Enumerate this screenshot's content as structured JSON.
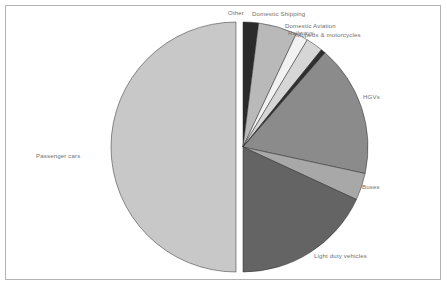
{
  "figure": {
    "background_color": "#ffffff",
    "border_color": "#b4b4b4",
    "label_color": "#6f6f6f"
  },
  "chart_data": {
    "type": "pie",
    "title": "",
    "subtitle": "",
    "xlabel": "",
    "ylabel": "",
    "legend_position": "none",
    "grid": false,
    "exploded_slice": "Passenger cars",
    "start_angle_deg": -90,
    "direction": "clockwise",
    "categories": [
      "Other",
      "Domestic Shipping",
      "Domestic Aviation",
      "Railways",
      "Mopeds & motorcycles",
      "HGVs",
      "Buses",
      "Light duty vehicles",
      "Passenger cars"
    ],
    "values": [
      2.0,
      5.0,
      1.6,
      2.2,
      0.6,
      17.0,
      3.5,
      18.1,
      50.0
    ],
    "unit": "%",
    "colors": [
      "#2b2b2b",
      "#b9b9b9",
      "#f2f2f2",
      "#d6d6d6",
      "#2f2f2f",
      "#8b8b8b",
      "#a8a8a8",
      "#646464",
      "#c8c8c8"
    ],
    "slices": [
      {
        "label": "Other",
        "value": 2.0,
        "color": "#2b2b2b"
      },
      {
        "label": "Domestic Shipping",
        "value": 5.0,
        "color": "#b9b9b9"
      },
      {
        "label": "Domestic Aviation",
        "value": 1.6,
        "color": "#f2f2f2"
      },
      {
        "label": "Railways",
        "value": 2.2,
        "color": "#d6d6d6"
      },
      {
        "label": "Mopeds & motorcycles",
        "value": 0.6,
        "color": "#2f2f2f"
      },
      {
        "label": "HGVs",
        "value": 17.0,
        "color": "#8b8b8b"
      },
      {
        "label": "Buses",
        "value": 3.5,
        "color": "#a8a8a8"
      },
      {
        "label": "Light duty vehicles",
        "value": 18.1,
        "color": "#646464"
      },
      {
        "label": "Passenger cars",
        "value": 50.0,
        "color": "#c8c8c8"
      }
    ]
  },
  "labels": {
    "other": "Other",
    "domestic_shipping": "Domestic Shipping",
    "domestic_aviation": "Domestic Aviation",
    "railways": "Railways",
    "mopeds_motorcycles": "Mopeds & motorcycles",
    "hgvs": "HGVs",
    "buses": "Buses",
    "light_duty_vehicles": "Light duty vehicles",
    "passenger_cars": "Passenger cars"
  }
}
